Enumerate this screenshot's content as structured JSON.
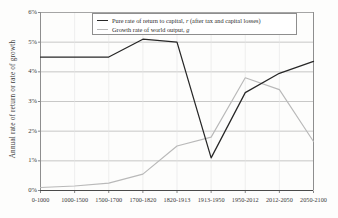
{
  "chart_data": {
    "type": "line",
    "title": "",
    "xlabel": "",
    "ylabel": "Annual rate of return or rate of growth",
    "categories": [
      "0-1000",
      "1000-1500",
      "1500-1700",
      "1700-1820",
      "1820-1913",
      "1913-1950",
      "1950-2012",
      "2012-2050",
      "2050-2100"
    ],
    "ylim": [
      0,
      6
    ],
    "yticks": [
      "0%",
      "1%",
      "2%",
      "3%",
      "4%",
      "5%",
      "6%"
    ],
    "ytick_values": [
      0,
      1,
      2,
      3,
      4,
      5,
      6
    ],
    "grid": true,
    "legend_position": "top-center",
    "series": [
      {
        "name": "Pure rate of return to capital, r (after tax and capital losses)",
        "color": "#272727",
        "values": [
          4.5,
          4.5,
          4.5,
          5.1,
          5.0,
          1.1,
          3.3,
          3.95,
          4.35
        ]
      },
      {
        "name": "Growth rate of world output, g",
        "color": "#b9b9b9",
        "values": [
          0.1,
          0.15,
          0.25,
          0.55,
          1.5,
          1.8,
          3.8,
          3.4,
          1.65
        ]
      }
    ]
  },
  "legend": {
    "entries": [
      {
        "swatch": "r",
        "prefix": "Pure rate of return to capital, ",
        "symbol": "r",
        "suffix": " (after tax and capital losses)"
      },
      {
        "swatch": "g",
        "prefix": "Growth rate of world output, ",
        "symbol": "g",
        "suffix": ""
      }
    ]
  },
  "axes": {
    "y_title": "Annual rate of return or rate of growth"
  }
}
